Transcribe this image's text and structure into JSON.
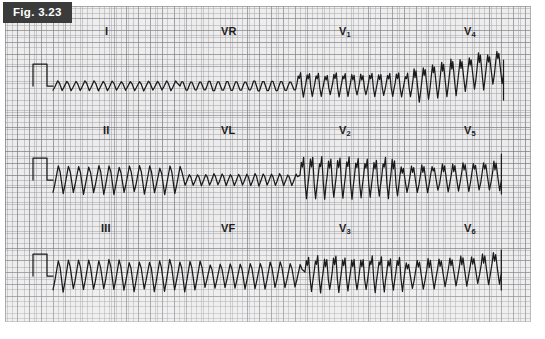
{
  "figure": {
    "tab_label": "Fig. 3.23",
    "caption": "",
    "tab_bg": "#3b3b3b",
    "tab_text_color": "#ffffff",
    "paper_bg": "#ececec",
    "grid_minor_color": "#96969b",
    "grid_major_color": "#78787d",
    "trace_color": "#1a1a1a"
  },
  "lead_labels": [
    {
      "name": "label-lead-I",
      "text": "I",
      "sub": "",
      "x": 105,
      "y": 25
    },
    {
      "name": "label-lead-VR",
      "text": "VR",
      "sub": "",
      "x": 221,
      "y": 25
    },
    {
      "name": "label-lead-V1",
      "text": "V",
      "sub": "1",
      "x": 339,
      "y": 25
    },
    {
      "name": "label-lead-V4",
      "text": "V",
      "sub": "4",
      "x": 464,
      "y": 25
    },
    {
      "name": "label-lead-II",
      "text": "II",
      "sub": "",
      "x": 103,
      "y": 124
    },
    {
      "name": "label-lead-VL",
      "text": "VL",
      "sub": "",
      "x": 221,
      "y": 124
    },
    {
      "name": "label-lead-V2",
      "text": "V",
      "sub": "2",
      "x": 339,
      "y": 124
    },
    {
      "name": "label-lead-V5",
      "text": "V",
      "sub": "5",
      "x": 464,
      "y": 124
    },
    {
      "name": "label-lead-III",
      "text": "III",
      "sub": "",
      "x": 101,
      "y": 222
    },
    {
      "name": "label-lead-VF",
      "text": "VF",
      "sub": "",
      "x": 221,
      "y": 222
    },
    {
      "name": "label-lead-V3",
      "text": "V",
      "sub": "3",
      "x": 339,
      "y": 222
    },
    {
      "name": "label-lead-V6",
      "text": "V",
      "sub": "6",
      "x": 464,
      "y": 222
    }
  ],
  "chart_data": {
    "type": "line",
    "title": "Fig. 3.23",
    "subtitle": "12-lead electrocardiogram recorded on standard ECG paper",
    "xlabel": "",
    "ylabel": "",
    "grid": true,
    "legend": "none",
    "paper": {
      "small_square_px": 2.42,
      "large_square_px": 12.1,
      "rows": 3,
      "columns": 4
    },
    "rows": [
      {
        "row": 1,
        "baseline_y": 86,
        "leads": [
          "I",
          "VR",
          "V1",
          "V4"
        ],
        "calibration_pulse": {
          "present": true,
          "x": 28,
          "width": 14,
          "height": 22
        }
      },
      {
        "row": 2,
        "baseline_y": 180,
        "leads": [
          "II",
          "VL",
          "V2",
          "V5"
        ],
        "calibration_pulse": {
          "present": true,
          "x": 28,
          "width": 14,
          "height": 22
        }
      },
      {
        "row": 3,
        "baseline_y": 276,
        "leads": [
          "III",
          "VF",
          "V3",
          "V6"
        ],
        "calibration_pulse": {
          "present": true,
          "x": 28,
          "width": 14,
          "height": 22
        }
      }
    ],
    "series": [
      {
        "name": "I",
        "row": 1,
        "x_start": 48,
        "x_end": 175,
        "morphology": "low-amplitude regular sawtooth flutter waves",
        "cycles": 14,
        "amplitude_px": 9
      },
      {
        "name": "VR",
        "row": 1,
        "x_start": 175,
        "x_end": 292,
        "morphology": "very low amplitude regular sawtooth flutter waves",
        "cycles": 13,
        "amplitude_px": 5
      },
      {
        "name": "V1",
        "row": 1,
        "x_start": 292,
        "x_end": 408,
        "morphology": "sharp biphasic flutter waves, moderate amplitude",
        "cycles": 13,
        "amplitude_px": 17
      },
      {
        "name": "V4",
        "row": 1,
        "x_start": 408,
        "x_end": 500,
        "morphology": "tall irregular complexes on rising baseline",
        "cycles": 10,
        "amplitude_px": 26
      },
      {
        "name": "II",
        "row": 2,
        "x_start": 48,
        "x_end": 180,
        "morphology": "large regular sawtooth flutter waves",
        "cycles": 13,
        "amplitude_px": 26
      },
      {
        "name": "VL",
        "row": 2,
        "x_start": 180,
        "x_end": 295,
        "morphology": "small regular sawtooth flutter waves",
        "cycles": 14,
        "amplitude_px": 11
      },
      {
        "name": "V2",
        "row": 2,
        "x_start": 295,
        "x_end": 395,
        "morphology": "tall sharp spiky complexes",
        "cycles": 11,
        "amplitude_px": 30
      },
      {
        "name": "V5",
        "row": 2,
        "x_start": 395,
        "x_end": 498,
        "morphology": "moderate irregular complexes",
        "cycles": 10,
        "amplitude_px": 21
      },
      {
        "name": "III",
        "row": 3,
        "x_start": 48,
        "x_end": 200,
        "morphology": "large regular sawtooth flutter waves",
        "cycles": 15,
        "amplitude_px": 29
      },
      {
        "name": "VF",
        "row": 3,
        "x_start": 200,
        "x_end": 300,
        "morphology": "large sawtooth flutter waves, slightly smaller",
        "cycles": 10,
        "amplitude_px": 24
      },
      {
        "name": "V3",
        "row": 3,
        "x_start": 300,
        "x_end": 400,
        "morphology": "sharp downward-dominant complexes",
        "cycles": 11,
        "amplitude_px": 26
      },
      {
        "name": "V6",
        "row": 3,
        "x_start": 400,
        "x_end": 498,
        "morphology": "sawtooth complexes with rising baseline",
        "cycles": 9,
        "amplitude_px": 22
      }
    ]
  }
}
